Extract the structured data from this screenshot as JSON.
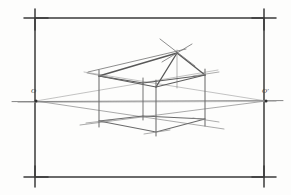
{
  "drawing": {
    "title": "Two-point perspective construction",
    "medium": "pencil sketch",
    "background_color": "#fdfdfc",
    "ink_color": "#4a4a4a",
    "frame": {
      "label": "border frame with corner registration crosses",
      "stroke_color": "#3b3b3b",
      "left": 35,
      "top": 18,
      "right": 264,
      "bottom": 177,
      "corner_tick_overshoot": 12
    },
    "horizon": {
      "label": "horizon line / eye level",
      "y": 101,
      "x_start": 12,
      "x_end": 283,
      "stroke_color": "#6b6b6b"
    },
    "vanishing_points": [
      {
        "id": "left",
        "label": "O",
        "x": 36,
        "y": 101
      },
      {
        "id": "right",
        "label": "O'",
        "x": 266,
        "y": 101
      }
    ],
    "verticals": [
      {
        "id": "left-corner",
        "x": 99,
        "y_top": 72,
        "y_bottom": 124,
        "note": "left rear corner"
      },
      {
        "id": "mid-rear",
        "x": 143,
        "y_top": 79,
        "y_bottom": 119,
        "note": "centre rear corner"
      },
      {
        "id": "front-corner",
        "x": 155,
        "y_top": 82,
        "y_bottom": 133,
        "note": "nearest front corner"
      },
      {
        "id": "right-corner",
        "x": 204,
        "y_top": 71,
        "y_bottom": 122,
        "note": "right rear corner"
      },
      {
        "id": "ridge-post",
        "x": 176,
        "y_top": 52,
        "y_bottom": 86,
        "note": "apex post up to ridge"
      }
    ],
    "apex": {
      "id": "ridge-apex",
      "x": 176,
      "y": 52,
      "label": "roof apex"
    },
    "box_top_edges": [
      {
        "from": [
          99,
          76
        ],
        "to": [
          155,
          87
        ]
      },
      {
        "from": [
          155,
          87
        ],
        "to": [
          204,
          75
        ]
      },
      {
        "from": [
          99,
          76
        ],
        "to": [
          143,
          83
        ]
      },
      {
        "from": [
          143,
          83
        ],
        "to": [
          204,
          75
        ]
      }
    ],
    "box_bottom_edges": [
      {
        "from": [
          99,
          121
        ],
        "to": [
          155,
          131
        ]
      },
      {
        "from": [
          155,
          131
        ],
        "to": [
          204,
          119
        ]
      },
      {
        "from": [
          99,
          121
        ],
        "to": [
          143,
          116
        ]
      },
      {
        "from": [
          143,
          116
        ],
        "to": [
          204,
          119
        ]
      }
    ],
    "roof_edges": [
      {
        "from": [
          99,
          76
        ],
        "to": [
          176,
          52
        ]
      },
      {
        "from": [
          176,
          52
        ],
        "to": [
          204,
          75
        ]
      },
      {
        "from": [
          176,
          52
        ],
        "to": [
          155,
          87
        ]
      }
    ],
    "convergence_lines": [
      {
        "from": [
          36,
          101
        ],
        "to": [
          221,
          128
        ],
        "note": "to left VP, lower right receding edge"
      },
      {
        "from": [
          36,
          101
        ],
        "to": [
          215,
          71
        ],
        "note": "to left VP, upper right receding edge"
      },
      {
        "from": [
          266,
          101
        ],
        "to": [
          84,
          124
        ],
        "note": "to right VP, lower left receding edge"
      },
      {
        "from": [
          266,
          101
        ],
        "to": [
          88,
          73
        ],
        "note": "to right VP, upper left receding edge"
      }
    ],
    "cross_marks": [
      {
        "x": 99,
        "y": 74,
        "note": "left top corner crossing"
      },
      {
        "x": 99,
        "y": 122,
        "note": "left bottom corner crossing"
      },
      {
        "x": 176,
        "y": 52,
        "note": "apex crossing"
      },
      {
        "x": 155,
        "y": 132,
        "note": "front bottom crossing"
      },
      {
        "x": 204,
        "y": 73,
        "note": "right top corner crossing"
      },
      {
        "x": 204,
        "y": 120,
        "note": "right bottom crossing"
      }
    ]
  }
}
